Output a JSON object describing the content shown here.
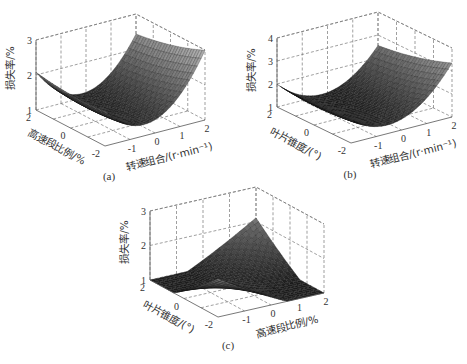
{
  "chart_data": [
    {
      "id": "a",
      "type": "surface3d",
      "caption": "(a)",
      "xlabel": "转速组合/(r·min⁻¹)",
      "ylabel": "高速段比例/%",
      "zlabel": "损失率/%",
      "x_ticks": [
        "-1",
        "0",
        "1",
        "2"
      ],
      "y_ticks": [
        "2",
        "0",
        "-2"
      ],
      "z_ticks": [
        "3",
        "2",
        "1"
      ],
      "xlim": [
        -2,
        2
      ],
      "ylim": [
        -2,
        2
      ],
      "zlim": [
        1,
        3
      ],
      "surface": "U-shaped parabola along 转速组合 axis, nearly flat along 高速段比例; min ≈1.15 near x≈-0.5, rises to ≈3.0 at x=2,y=-2 and ≈1.6 at x=-2",
      "model": {
        "z0": 1.15,
        "ax": 0.28,
        "x0": -0.3,
        "ay": 0.02,
        "by": -0.06,
        "bxy": -0.04
      }
    },
    {
      "id": "b",
      "type": "surface3d",
      "caption": "(b)",
      "xlabel": "转速组合/(r·min⁻¹)",
      "ylabel": "叶片锥度/(°)",
      "zlabel": "损失率/%",
      "x_ticks": [
        "-1",
        "0",
        "1",
        "2"
      ],
      "y_ticks": [
        "2",
        "0",
        "-2"
      ],
      "z_ticks": [
        "4",
        "3",
        "2",
        "1"
      ],
      "xlim": [
        -2,
        2
      ],
      "ylim": [
        -2,
        2
      ],
      "zlim": [
        1,
        4
      ],
      "surface": "U-shaped parabola along 转速组合 axis; min ≈1.1, rises to ≈3.7 at x=2,y=-2 and ≈2.0 at x=-2",
      "model": {
        "z0": 1.1,
        "ax": 0.3,
        "x0": -0.4,
        "ay": 0.03,
        "by": -0.1,
        "bxy": -0.05
      }
    },
    {
      "id": "c",
      "type": "surface3d",
      "caption": "(c)",
      "xlabel": "高速段比例/%",
      "ylabel": "叶片锥度/(°)",
      "zlabel": "损失率/%",
      "x_ticks": [
        "-1",
        "0",
        "1",
        "2"
      ],
      "y_ticks": [
        "2",
        "0",
        "-2"
      ],
      "z_ticks": [
        "3",
        "2",
        "1"
      ],
      "xlim": [
        -2,
        2
      ],
      "ylim": [
        -2,
        2
      ],
      "zlim": [
        1,
        3
      ],
      "surface": "Saddle/twisted surface: low ≈1.1 near center, peak ≈2.8 at back corner (x=-2? y=-2 side), edges ≈1.3-1.5",
      "model": {
        "z0": 1.15,
        "ax": 0.02,
        "x0": 0,
        "ay": 0.02,
        "by": 0,
        "bxy": 0.2
      }
    }
  ]
}
